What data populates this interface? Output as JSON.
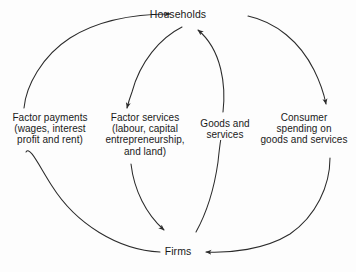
{
  "diagram": {
    "nodes": {
      "households": "Households",
      "firms": "Firms"
    },
    "flows": [
      {
        "id": "factor-payments",
        "lines": [
          "Factor payments",
          "(wages, interest",
          "profit and rent)"
        ],
        "from": "Firms",
        "to": "Households",
        "direction": "up"
      },
      {
        "id": "factor-services",
        "lines": [
          "Factor services",
          "(labour, capital",
          "entrepreneurship,",
          "and land)"
        ],
        "from": "Households",
        "to": "Firms",
        "direction": "down"
      },
      {
        "id": "goods-services",
        "lines": [
          "Goods and",
          "services"
        ],
        "from": "Firms",
        "to": "Households",
        "direction": "up"
      },
      {
        "id": "consumer-spending",
        "lines": [
          "Consumer",
          "spending on",
          "goods and services"
        ],
        "from": "Households",
        "to": "Firms",
        "direction": "down"
      }
    ],
    "style": {
      "background": "#fdfdfd",
      "stroke": "#2b2b2b",
      "text": "#1a1a1a"
    }
  }
}
